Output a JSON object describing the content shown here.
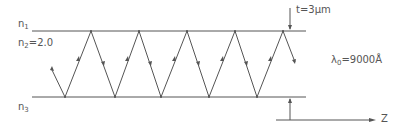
{
  "labels": {
    "n1": {
      "base": "n",
      "sub": "1"
    },
    "n2": {
      "base": "n",
      "sub": "2",
      "value": "=2.0"
    },
    "n3": {
      "base": "n",
      "sub": "3"
    },
    "thickness": "t=3μm",
    "wavelength": {
      "base": "λ",
      "sub": "0",
      "value": "=9000Å"
    },
    "axis": "Z"
  },
  "geometry": {
    "top_line_y": 31,
    "bottom_line_y": 97,
    "line_x_start": 32,
    "line_x_end": 306,
    "top_vertices_x": [
      91,
      139,
      187,
      235,
      283
    ],
    "bottom_vertices_x": [
      65,
      115,
      161,
      209,
      257
    ]
  },
  "colors": {
    "line": "#555555",
    "text": "#555555"
  }
}
